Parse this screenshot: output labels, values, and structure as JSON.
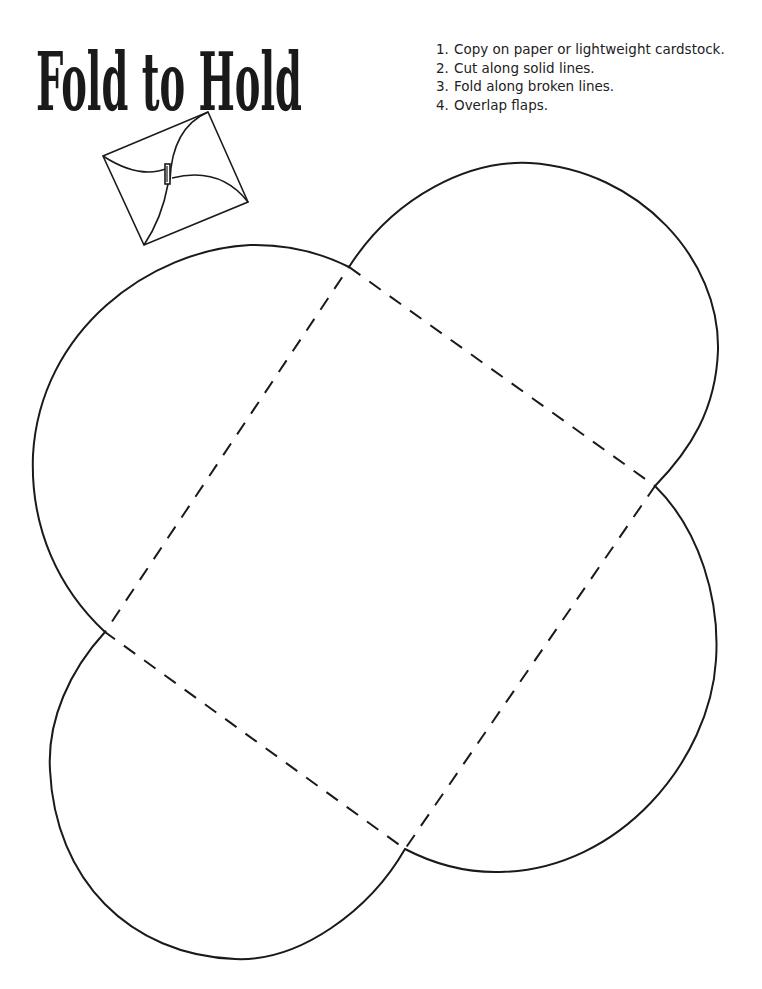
{
  "header": {
    "title": "Fold to Hold"
  },
  "instructions": [
    {
      "number": "1.",
      "text": "Copy on paper or lightweight cardstock."
    },
    {
      "number": "2.",
      "text": "Cut along solid lines."
    },
    {
      "number": "3.",
      "text": "Fold along broken lines."
    },
    {
      "number": "4.",
      "text": "Overlap flaps."
    }
  ],
  "illustration": {
    "icon": "folded-envelope-icon",
    "line_color": "#1a1a1a"
  },
  "template": {
    "cut_line_style": "solid",
    "fold_line_style": "dashed",
    "line_color": "#1a1a1a",
    "corners": {
      "top": [
        349,
        267
      ],
      "right": [
        655,
        486
      ],
      "bottom": [
        405,
        849
      ],
      "left": [
        105,
        632
      ]
    }
  }
}
